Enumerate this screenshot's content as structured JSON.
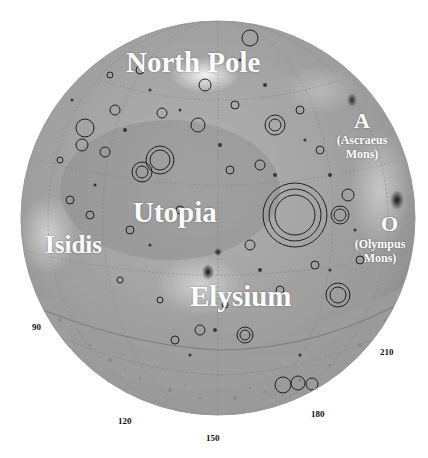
{
  "map": {
    "subject": "Mars northern hemisphere globe",
    "style": "grayscale shaded relief with crater outlines",
    "colors": {
      "background": "#ffffff",
      "globe_light": "#c9c9c9",
      "globe_mid": "#a8a8a8",
      "globe_dark": "#7d7d7d",
      "crater_stroke": "#222222",
      "label_text": "#ffffff",
      "tick_text": "#111111"
    },
    "regions": [
      {
        "id": "north-pole",
        "label": "North Pole"
      },
      {
        "id": "utopia",
        "label": "Utopia"
      },
      {
        "id": "isidis",
        "label": "Isidis"
      },
      {
        "id": "elysium",
        "label": "Elysium"
      }
    ],
    "volcanoes": [
      {
        "id": "ascraeus",
        "symbol": "A",
        "name_line1": "(Ascraeus",
        "name_line2": "Mons)"
      },
      {
        "id": "olympus",
        "symbol": "O",
        "name_line1": "(Olympus",
        "name_line2": "Mons)"
      }
    ],
    "longitude_ticks": [
      "90",
      "120",
      "150",
      "180",
      "210"
    ]
  }
}
